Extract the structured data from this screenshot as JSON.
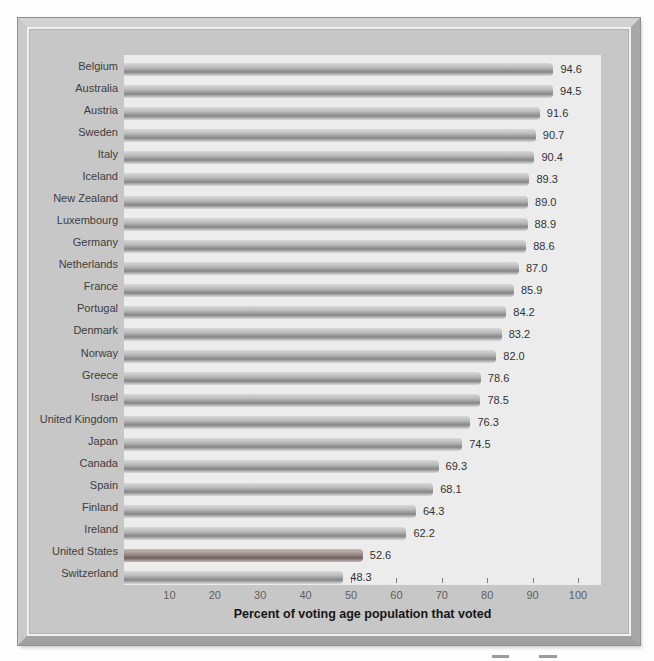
{
  "chart_data": {
    "type": "bar",
    "orientation": "horizontal",
    "title": "",
    "xlabel": "Percent of voting age population that voted",
    "ylabel": "",
    "xlim": [
      0,
      105
    ],
    "x_ticks": [
      10,
      20,
      30,
      40,
      50,
      60,
      70,
      80,
      90,
      100
    ],
    "grid": false,
    "legend": false,
    "categories": [
      "Belgium",
      "Australia",
      "Austria",
      "Sweden",
      "Italy",
      "Iceland",
      "New Zealand",
      "Luxembourg",
      "Germany",
      "Netherlands",
      "France",
      "Portugal",
      "Denmark",
      "Norway",
      "Greece",
      "Israel",
      "United Kingdom",
      "Japan",
      "Canada",
      "Spain",
      "Finland",
      "Ireland",
      "United States",
      "Switzerland"
    ],
    "values": [
      94.6,
      94.5,
      91.6,
      90.7,
      90.4,
      89.3,
      89.0,
      88.9,
      88.6,
      87.0,
      85.9,
      84.2,
      83.2,
      82.0,
      78.6,
      78.5,
      76.3,
      74.5,
      69.3,
      68.1,
      64.3,
      62.2,
      52.6,
      48.3
    ],
    "value_labels": [
      "94.6",
      "94.5",
      "91.6",
      "90.7",
      "90.4",
      "89.3",
      "89.0",
      "88.9",
      "88.6",
      "87.0",
      "85.9",
      "84.2",
      "83.2",
      "82.0",
      "78.6",
      "78.5",
      "76.3",
      "74.5",
      "69.3",
      "68.1",
      "64.3",
      "62.2",
      "52.6",
      "48.3"
    ],
    "highlighted_category": "United States",
    "colors": {
      "bar_mid": "#8a8a8a",
      "bar_light": "#d8d8d8",
      "highlighted_bar_mid": "#756461",
      "plot_background": "#ececec",
      "frame_background": "#c7c7c7",
      "label_text": "#3d3d3d",
      "tick_text": "#5f5f5f"
    }
  }
}
